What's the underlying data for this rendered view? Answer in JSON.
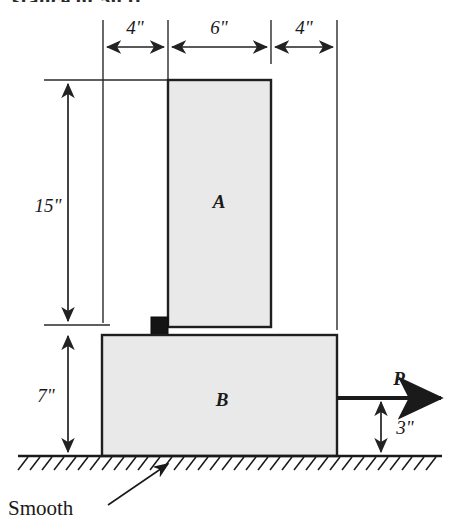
{
  "figure": {
    "title_fragment": "stance of 50 ft.",
    "type": "engineering-free-body-diagram",
    "ground_note": "Smooth",
    "bodies": [
      {
        "id": "A",
        "label": "A",
        "description": "upper vertical block"
      },
      {
        "id": "B",
        "label": "B",
        "description": "lower base block"
      }
    ],
    "force": {
      "label": "P",
      "direction": "right",
      "applied_height_label": "3\""
    },
    "dimensions": {
      "horizontal": [
        {
          "label": "4\"",
          "span": "left edge of B to left edge of A"
        },
        {
          "label": "6\"",
          "span": "width of block A"
        },
        {
          "label": "4\"",
          "span": "right edge of A to right edge of B"
        }
      ],
      "vertical": [
        {
          "label": "15\"",
          "span": "height of block A"
        },
        {
          "label": "7\"",
          "span": "height of block B"
        },
        {
          "label": "3\"",
          "span": "height of force P above ground"
        }
      ]
    },
    "colors": {
      "block_fill": "#e9e9e9",
      "outline": "#1f1f1f",
      "dimension_line": "#2a2a2a",
      "ground_line": "#1a1a1a",
      "stop_block": "#141414",
      "text": "#1a1a1a"
    }
  }
}
